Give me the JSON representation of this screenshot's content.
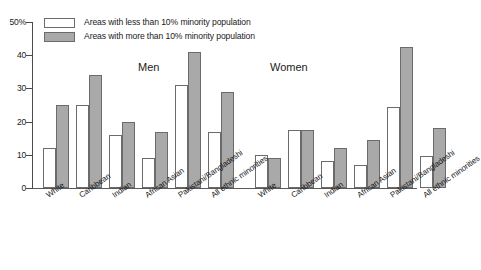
{
  "chart_data": {
    "type": "bar",
    "title": "",
    "xlabel": "",
    "ylabel": "",
    "ylim": [
      0,
      50
    ],
    "grid": false,
    "legend_position": "top-left",
    "y_ticks": [
      {
        "value": 50,
        "label": "50%"
      },
      {
        "value": 40,
        "label": "40"
      },
      {
        "value": 30,
        "label": "30"
      },
      {
        "value": 20,
        "label": "20"
      },
      {
        "value": 10,
        "label": "10"
      },
      {
        "value": 0,
        "label": "0"
      }
    ],
    "categories": [
      "White",
      "Caribbean",
      "Indian",
      "African Asian",
      "Pakistani/Bangladeshi",
      "All ethnic minorities"
    ],
    "legend": [
      "Areas with less than 10% minority population",
      "Areas with more than 10% minority population"
    ],
    "panels": [
      {
        "name": "Men",
        "series": [
          {
            "name": "Areas with less than 10% minority population",
            "values": [
              12,
              25,
              16,
              9,
              31,
              17
            ]
          },
          {
            "name": "Areas with more than 10% minority population",
            "values": [
              25,
              34,
              20,
              17,
              41,
              29
            ]
          }
        ]
      },
      {
        "name": "Women",
        "series": [
          {
            "name": "Areas with less than 10% minority population",
            "values": [
              10,
              17.5,
              8,
              7,
              24.5,
              9.5
            ]
          },
          {
            "name": "Areas with more than 10% minority population",
            "values": [
              9,
              17.5,
              12,
              14.5,
              42.5,
              18
            ]
          }
        ]
      }
    ],
    "colors": {
      "less_than_10": "#ffffff",
      "more_than_10": "#a9a9a9",
      "bar_border": "#6b6b6b",
      "axis": "#4a4a4a",
      "text": "#1a1a1a",
      "background": "#ffffff"
    }
  }
}
